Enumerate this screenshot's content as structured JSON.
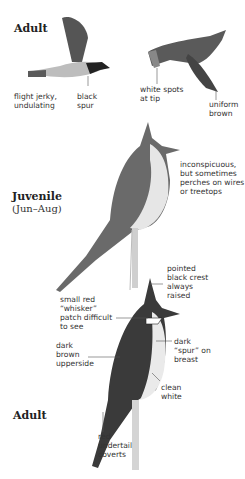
{
  "sections": {
    "adult_flight": {
      "label": "Adult"
    },
    "juvenile": {
      "label": "Juvenile",
      "sublabel": "(Jun–Aug)"
    },
    "adult_perched": {
      "label": "Adult"
    }
  },
  "annotations": {
    "flight_jerky": [
      "flight jerky,",
      "undulating"
    ],
    "black_spur": [
      "black",
      "spur"
    ],
    "white_spots": [
      "white spots",
      "at tip"
    ],
    "uniform_brown": [
      "uniform",
      "brown"
    ],
    "inconspicuous": [
      "inconspicuous,",
      "but sometimes",
      "perches on wires",
      "or treetops"
    ],
    "pointed_crest": [
      "pointed",
      "black crest",
      "always",
      "raised"
    ],
    "whisker": [
      "small red",
      "“whisker”",
      "patch difficult",
      "to see"
    ],
    "dark_upperside": [
      "dark",
      "brown",
      "upperside"
    ],
    "dark_spur": [
      "dark",
      "“spur” on",
      "breast"
    ],
    "clean_white": [
      "clean",
      "white"
    ],
    "red_undertail": [
      "red",
      "undertail",
      "coverts"
    ]
  },
  "colors": {
    "ink": "#333333",
    "dark": "#2a2a2a",
    "mid": "#6e6e6e",
    "light": "#d8d8d8"
  }
}
